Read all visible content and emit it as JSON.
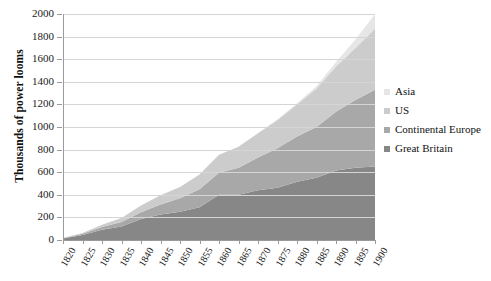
{
  "chart_data": {
    "type": "area",
    "stacked": true,
    "title": "",
    "xlabel": "",
    "ylabel": "Thousands of power looms",
    "ylim": [
      0,
      2000
    ],
    "ytick_step": 200,
    "yticks": [
      0,
      200,
      400,
      600,
      800,
      1000,
      1200,
      1400,
      1600,
      1800,
      2000
    ],
    "grid": true,
    "legend_position": "right",
    "categories": [
      1820,
      1825,
      1830,
      1835,
      1840,
      1845,
      1850,
      1855,
      1860,
      1865,
      1870,
      1875,
      1880,
      1885,
      1890,
      1895,
      1900
    ],
    "xtick_labels": [
      "1820",
      "1825",
      "1830",
      "1835",
      "1840",
      "1845",
      "1850",
      "1855",
      "1860",
      "1865",
      "1870",
      "1875",
      "1880",
      "1885",
      "1890",
      "1895",
      "1900"
    ],
    "series": [
      {
        "name": "Great Britain",
        "color": "#878787",
        "values": [
          14,
          45,
          90,
          120,
          185,
          225,
          250,
          290,
          400,
          400,
          440,
          463,
          515,
          550,
          615,
          640,
          650
        ]
      },
      {
        "name": "Continental Europe",
        "color": "#a8a8a8",
        "values": [
          2,
          10,
          25,
          40,
          60,
          90,
          120,
          160,
          195,
          240,
          290,
          350,
          400,
          450,
          520,
          600,
          680
        ]
      },
      {
        "name": "US",
        "color": "#cccccc",
        "values": [
          3,
          8,
          20,
          35,
          60,
          80,
          100,
          130,
          160,
          185,
          215,
          250,
          285,
          340,
          400,
          460,
          540
        ]
      },
      {
        "name": "Asia",
        "color": "#e6e6e6",
        "values": [
          0,
          0,
          0,
          0,
          0,
          0,
          0,
          0,
          0,
          0,
          2,
          5,
          10,
          20,
          40,
          75,
          130
        ]
      }
    ],
    "stack_order_bottom_to_top": [
      "Great Britain",
      "Continental Europe",
      "US",
      "Asia"
    ],
    "totals": [
      19,
      63,
      135,
      195,
      305,
      395,
      470,
      580,
      755,
      825,
      947,
      1068,
      1210,
      1360,
      1575,
      1775,
      2000
    ]
  },
  "legend": {
    "items": [
      {
        "label": "Asia",
        "color": "#e6e6e6"
      },
      {
        "label": "US",
        "color": "#cccccc"
      },
      {
        "label": "Continental Europe",
        "color": "#a8a8a8"
      },
      {
        "label": "Great Britain",
        "color": "#878787"
      }
    ]
  },
  "axis": {
    "y_title": "Thousands of power looms"
  }
}
